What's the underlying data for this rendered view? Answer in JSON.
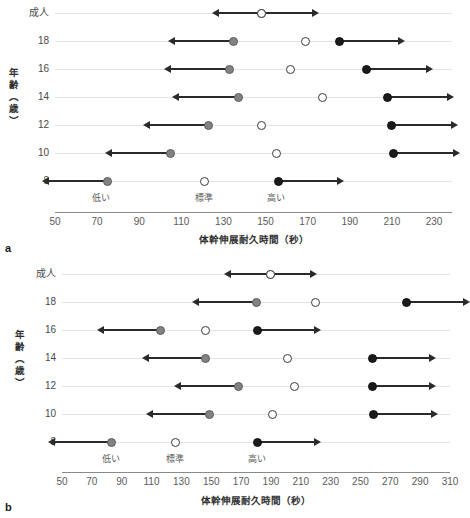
{
  "figure": {
    "y_axis_title": "年齢（歳）",
    "x_axis_title": "体幹伸展耐久時間（秒）",
    "zone_labels": {
      "low": "低い",
      "standard": "標準",
      "high": "高い"
    },
    "row_categories": [
      "成人",
      "18",
      "16",
      "14",
      "12",
      "10",
      "8"
    ]
  },
  "panels": [
    {
      "letter": "a"
    },
    {
      "letter": "b"
    }
  ],
  "chart_data": [
    {
      "type": "scatter",
      "panel": "a",
      "title": "",
      "xlabel": "体幹伸展耐久時間（秒）",
      "ylabel": "年齢（歳）",
      "xlim": [
        50,
        230
      ],
      "xticks": [
        50,
        70,
        90,
        110,
        130,
        150,
        170,
        190,
        210,
        230
      ],
      "xtick_labels": [
        "50",
        "70",
        "90",
        "110",
        "130",
        "150",
        "170",
        "190",
        "210",
        "230"
      ],
      "categories": [
        "成人",
        "18",
        "16",
        "14",
        "12",
        "10",
        "8"
      ],
      "grid": true,
      "legend": "none",
      "zone_markers": [
        {
          "label": "低い",
          "x": 72
        },
        {
          "label": "標準",
          "x": 121
        },
        {
          "label": "高い",
          "x": 155
        }
      ],
      "series": [
        {
          "name": "低い (gray, arrow left)",
          "marker": "gray",
          "arrow": "left",
          "points": [
            {
              "category": "成人",
              "x": null
            },
            {
              "category": "18",
              "x": 135
            },
            {
              "category": "16",
              "x": 133
            },
            {
              "category": "14",
              "x": 137
            },
            {
              "category": "12",
              "x": 123
            },
            {
              "category": "10",
              "x": 105
            },
            {
              "category": "8",
              "x": 75
            }
          ]
        },
        {
          "name": "標準 (open)",
          "marker": "open",
          "arrow": "none",
          "points": [
            {
              "category": "成人",
              "x": 148
            },
            {
              "category": "18",
              "x": 169
            },
            {
              "category": "16",
              "x": 162
            },
            {
              "category": "14",
              "x": 177
            },
            {
              "category": "12",
              "x": 148
            },
            {
              "category": "10",
              "x": 155
            },
            {
              "category": "8",
              "x": 121
            }
          ]
        },
        {
          "name": "高い (black, arrow right)",
          "marker": "black",
          "arrow": "right",
          "points": [
            {
              "category": "成人",
              "x": null
            },
            {
              "category": "18",
              "x": 185
            },
            {
              "category": "16",
              "x": 198
            },
            {
              "category": "14",
              "x": 208
            },
            {
              "category": "12",
              "x": 210
            },
            {
              "category": "10",
              "x": 211
            },
            {
              "category": "8",
              "x": 156
            }
          ]
        }
      ],
      "adult_range": {
        "category": "成人",
        "center": 148,
        "left": 128,
        "right": 172
      }
    },
    {
      "type": "scatter",
      "panel": "b",
      "title": "",
      "xlabel": "体幹伸展耐久時間（秒）",
      "ylabel": "年齢（歳）",
      "xlim": [
        50,
        310
      ],
      "xticks": [
        50,
        70,
        90,
        110,
        130,
        150,
        170,
        190,
        210,
        230,
        250,
        270,
        290,
        310
      ],
      "xtick_labels": [
        "50",
        "70",
        "90",
        "110",
        "130",
        "150",
        "170",
        "190",
        "210",
        "230",
        "250",
        "270",
        "290",
        "310"
      ],
      "categories": [
        "成人",
        "18",
        "16",
        "14",
        "12",
        "10",
        "8"
      ],
      "grid": true,
      "legend": "none",
      "zone_markers": [
        {
          "label": "低い",
          "x": 83
        },
        {
          "label": "標準",
          "x": 126
        },
        {
          "label": "高い",
          "x": 181
        }
      ],
      "series": [
        {
          "name": "低い (gray, arrow left)",
          "marker": "gray",
          "arrow": "left",
          "points": [
            {
              "category": "成人",
              "x": null
            },
            {
              "category": "18",
              "x": 180
            },
            {
              "category": "16",
              "x": 116
            },
            {
              "category": "14",
              "x": 146
            },
            {
              "category": "12",
              "x": 168
            },
            {
              "category": "10",
              "x": 149
            },
            {
              "category": "8",
              "x": 83
            }
          ]
        },
        {
          "name": "標準 (open)",
          "marker": "open",
          "arrow": "none",
          "points": [
            {
              "category": "成人",
              "x": 190
            },
            {
              "category": "18",
              "x": 220
            },
            {
              "category": "16",
              "x": 146
            },
            {
              "category": "14",
              "x": 201
            },
            {
              "category": "12",
              "x": 206
            },
            {
              "category": "10",
              "x": 191
            },
            {
              "category": "8",
              "x": 126
            }
          ]
        },
        {
          "name": "高い (black, arrow right)",
          "marker": "black",
          "arrow": "right",
          "points": [
            {
              "category": "成人",
              "x": null
            },
            {
              "category": "18",
              "x": 281
            },
            {
              "category": "16",
              "x": 181
            },
            {
              "category": "14",
              "x": 258
            },
            {
              "category": "12",
              "x": 258
            },
            {
              "category": "10",
              "x": 259
            },
            {
              "category": "8",
              "x": 181
            }
          ]
        }
      ],
      "adult_range": {
        "category": "成人",
        "center": 190,
        "left": 163,
        "right": 216
      }
    }
  ]
}
